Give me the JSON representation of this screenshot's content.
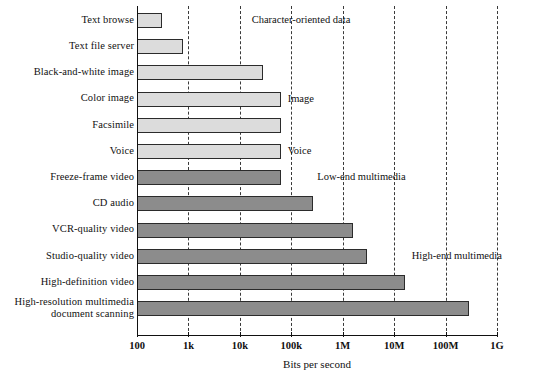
{
  "chart_data": {
    "type": "bar",
    "orientation": "horizontal",
    "title": "",
    "xlabel": "Bits per second",
    "ylabel": "",
    "xscale": "log",
    "xlim": [
      100,
      1000000000
    ],
    "grid": true,
    "legend": false,
    "xtick_labels": [
      "100",
      "1k",
      "10k",
      "100k",
      "1M",
      "10M",
      "100M",
      "1G"
    ],
    "xtick_values": [
      100,
      1000,
      10000,
      100000,
      1000000,
      10000000,
      100000000,
      1000000000
    ],
    "categories": [
      "Text browse",
      "Text file server",
      "Black-and-white image",
      "Color image",
      "Facsimile",
      "Voice",
      "Freeze-frame video",
      "CD audio",
      "VCR-quality video",
      "Studio-quality video",
      "High-definition video",
      "High-resolution multimedia\ndocument scanning"
    ],
    "values": [
      300,
      800,
      28000,
      64000,
      64000,
      64000,
      64000,
      260000,
      1600000,
      3000000,
      16000000,
      280000000
    ],
    "bar_styles": [
      "light",
      "light",
      "light",
      "light",
      "light",
      "light",
      "dark",
      "dark",
      "dark",
      "dark",
      "dark",
      "dark"
    ],
    "annotations": [
      {
        "text": "Character-oriented data",
        "x_value": 17000,
        "category_index": 0
      },
      {
        "text": "Image",
        "x_value": 85000,
        "category_index": 3
      },
      {
        "text": "Voice",
        "x_value": 85000,
        "category_index": 5
      },
      {
        "text": "Low-end multimedia",
        "x_value": 320000,
        "category_index": 6
      },
      {
        "text": "High-end multimedia",
        "x_value": 22000000,
        "category_index": 9
      }
    ],
    "colors": {
      "bar_light": "#dcdcdc",
      "bar_dark": "#8c8c8c",
      "bar_border": "#2b2b2b",
      "axis": "#111111",
      "grid": "#3a3a3a",
      "background": "#ffffff",
      "text": "#111111"
    }
  }
}
